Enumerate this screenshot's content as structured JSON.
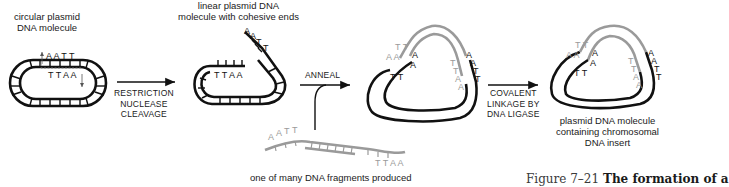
{
  "figure": {
    "caption_number": "Figure 7–21",
    "caption_title": "The formation of a"
  },
  "labels": {
    "circular_plasmid": [
      "circular plasmid",
      "DNA molecule"
    ],
    "linear_plasmid": [
      "linear plasmid DNA",
      "molecule with cohesive ends"
    ],
    "fragments": [
      "one of many DNA fragments produced"
    ],
    "recombinant": [
      "plasmid DNA molecule",
      "containing chromosomal",
      "DNA insert"
    ]
  },
  "steps": {
    "step1": [
      "RESTRICTION",
      "NUCLEASE",
      "CLEAVAGE"
    ],
    "step2": [
      "ANNEAL"
    ],
    "step3": [
      "COVALENT",
      "LINKAGE BY",
      "DNA LIGASE"
    ]
  },
  "sequences": {
    "top_site": "AATT",
    "bottom_site": "TTAA",
    "cohesive_end_top": [
      "A",
      "A",
      "T",
      "T"
    ],
    "cohesive_end_bottom": [
      "T",
      "T",
      "A",
      "A"
    ]
  },
  "colors": {
    "plasmid_dna": "#111111",
    "insert_dna": "#9a9a9a",
    "background": "#ffffff"
  }
}
